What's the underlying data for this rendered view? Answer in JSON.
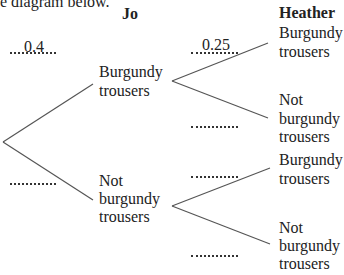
{
  "intro_text": "e diagram below.",
  "headers": {
    "first": "Jo",
    "second": "Heather"
  },
  "jo": {
    "burgundy": {
      "line1": "Burgundy",
      "line2": "trousers",
      "probability": "0.4"
    },
    "not_burgundy": {
      "line1": "Not",
      "line2": "burgundy",
      "line3": "trousers",
      "probability": ""
    }
  },
  "heather": {
    "after_burgundy": {
      "burgundy": {
        "line1": "Burgundy",
        "line2": "trousers",
        "probability": "0.25"
      },
      "not_burgundy": {
        "line1": "Not",
        "line2": "burgundy",
        "line3": "trousers",
        "probability": ""
      }
    },
    "after_not_burgundy": {
      "burgundy": {
        "line1": "Burgundy",
        "line2": "trousers",
        "probability": ""
      },
      "not_burgundy": {
        "line1": "Not",
        "line2": "burgundy",
        "line3": "trousers",
        "probability": ""
      }
    }
  },
  "colors": {
    "line": "#555555",
    "text": "#222222"
  }
}
